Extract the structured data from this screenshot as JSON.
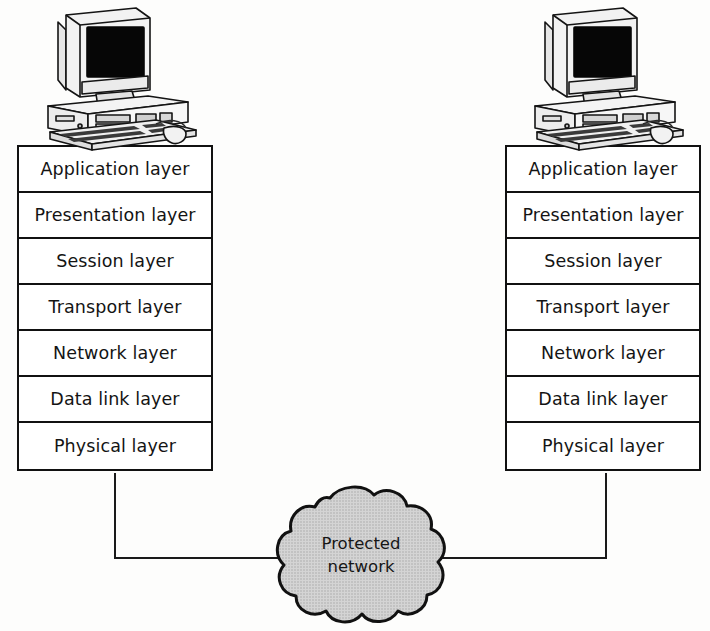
{
  "diagram": {
    "background_color": "#fdfdfc",
    "line_color": "#1a1a1a",
    "box_fill": "#ffffff",
    "cloud_fill": "#cdcdcd",
    "cloud_outline": "#111111",
    "screen_fill": "#000000"
  },
  "left_host": {
    "icon": "desktop-computer-icon",
    "layers": [
      {
        "label": "Application layer"
      },
      {
        "label": "Presentation layer"
      },
      {
        "label": "Session layer"
      },
      {
        "label": "Transport layer"
      },
      {
        "label": "Network layer"
      },
      {
        "label": "Data link layer"
      },
      {
        "label": "Physical layer"
      }
    ]
  },
  "right_host": {
    "icon": "desktop-computer-icon",
    "layers": [
      {
        "label": "Application layer"
      },
      {
        "label": "Presentation layer"
      },
      {
        "label": "Session layer"
      },
      {
        "label": "Transport layer"
      },
      {
        "label": "Network layer"
      },
      {
        "label": "Data link layer"
      },
      {
        "label": "Physical layer"
      }
    ]
  },
  "network_cloud": {
    "icon": "cloud-icon",
    "line1": "Protected",
    "line2": "network"
  },
  "connectors": {
    "left_label": "left-host-to-network-link",
    "right_label": "right-host-to-network-link"
  }
}
